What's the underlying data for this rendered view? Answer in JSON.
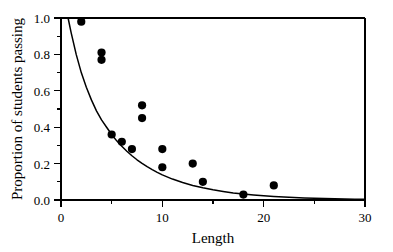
{
  "chart_data": {
    "type": "scatter",
    "title": "",
    "xlabel": "Length",
    "ylabel": "Proportion of students passing",
    "xlim": [
      0,
      30
    ],
    "ylim": [
      0.0,
      1.0
    ],
    "xticks": [
      0,
      10,
      20,
      30
    ],
    "xtick_labels": [
      "0",
      "10",
      "20",
      "30"
    ],
    "xminor_ticks": [
      5,
      15,
      25
    ],
    "yticks": [
      0.0,
      0.2,
      0.4,
      0.6,
      0.8,
      1.0
    ],
    "ytick_labels": [
      "0.0",
      "0.2",
      "0.4",
      "0.6",
      "0.8",
      "1.0"
    ],
    "yminor_ticks": [
      0.1,
      0.3,
      0.5,
      0.7,
      0.9
    ],
    "grid": false,
    "legend": null,
    "marker": "filled-circle",
    "marker_color": "#000000",
    "points": [
      {
        "x": 2,
        "y": 0.98
      },
      {
        "x": 4,
        "y": 0.81
      },
      {
        "x": 4,
        "y": 0.77
      },
      {
        "x": 5,
        "y": 0.36
      },
      {
        "x": 6,
        "y": 0.32
      },
      {
        "x": 7,
        "y": 0.28
      },
      {
        "x": 8,
        "y": 0.52
      },
      {
        "x": 8,
        "y": 0.45
      },
      {
        "x": 10,
        "y": 0.28
      },
      {
        "x": 10,
        "y": 0.18
      },
      {
        "x": 13,
        "y": 0.2
      },
      {
        "x": 14,
        "y": 0.1
      },
      {
        "x": 18,
        "y": 0.03
      },
      {
        "x": 21,
        "y": 0.08
      }
    ],
    "series": [
      {
        "name": "Fitted exponential decay curve",
        "type": "line",
        "x": [
          0.7,
          1.0,
          1.5,
          2.0,
          2.5,
          3.0,
          3.5,
          4.0,
          4.5,
          5.0,
          5.5,
          6.0,
          6.5,
          7.0,
          7.5,
          8.0,
          8.5,
          9.0,
          9.5,
          10.0,
          11.0,
          12.0,
          13.0,
          14.0,
          15.0,
          16.0,
          17.0,
          18.0,
          19.0,
          20.0,
          21.0,
          22.0,
          23.0,
          24.0,
          25.0,
          26.0,
          27.0,
          28.0,
          29.0,
          30.0
        ],
        "y": [
          1.0,
          0.92,
          0.8,
          0.7,
          0.62,
          0.55,
          0.49,
          0.44,
          0.4,
          0.36,
          0.325,
          0.295,
          0.268,
          0.243,
          0.221,
          0.201,
          0.183,
          0.167,
          0.152,
          0.138,
          0.115,
          0.096,
          0.08,
          0.067,
          0.056,
          0.047,
          0.039,
          0.033,
          0.028,
          0.023,
          0.019,
          0.016,
          0.0135,
          0.0115,
          0.0095,
          0.008,
          0.0068,
          0.0057,
          0.0048,
          0.004
        ]
      }
    ],
    "axis_color": "#000000",
    "background_color": "#ffffff"
  },
  "plot_geometry": {
    "left_px": 61,
    "right_px": 365,
    "top_px": 18,
    "bottom_px": 200
  }
}
